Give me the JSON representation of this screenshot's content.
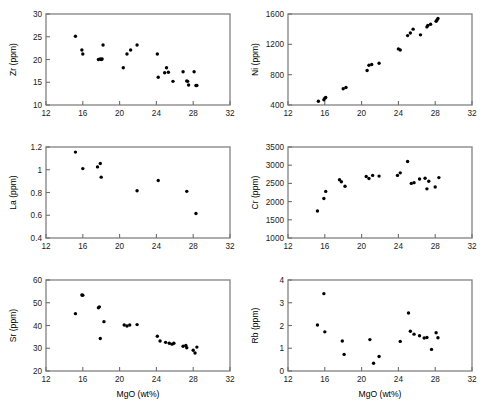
{
  "figure": {
    "title": "",
    "shared_xlabel": "MgO (wt%)",
    "xlim": [
      12,
      32
    ],
    "xticks": [
      12,
      16,
      20,
      24,
      28,
      32
    ],
    "point_color": "#000000",
    "axis_color": "#8a8a8a"
  },
  "chart_data": [
    {
      "type": "scatter",
      "id": "zr",
      "title": "",
      "xlabel": "MgO (wt%)",
      "ylabel": "Zr (ppm)",
      "xlim": [
        12,
        32
      ],
      "ylim": [
        10,
        30
      ],
      "xticks": [
        12,
        16,
        20,
        24,
        28,
        32
      ],
      "yticks": [
        10,
        15,
        20,
        25,
        30
      ],
      "grid": false,
      "legend": "none",
      "x": [
        15.2,
        15.9,
        16.0,
        17.7,
        17.9,
        18.0,
        18.1,
        18.2,
        20.4,
        20.8,
        21.2,
        21.9,
        24.1,
        24.2,
        24.9,
        25.1,
        25.3,
        25.8,
        26.9,
        27.3,
        27.4,
        27.5,
        28.1,
        28.3,
        28.4
      ],
      "y": [
        25.1,
        22.1,
        21.2,
        20.0,
        20.1,
        20.0,
        20.1,
        23.2,
        18.2,
        21.2,
        22.1,
        23.2,
        21.2,
        16.1,
        17.1,
        18.2,
        17.2,
        15.2,
        17.3,
        15.3,
        15.2,
        14.4,
        17.3,
        14.3,
        14.3
      ]
    },
    {
      "type": "scatter",
      "id": "ni",
      "title": "",
      "xlabel": "MgO (wt%)",
      "ylabel": "Ni (ppm)",
      "xlim": [
        12,
        32
      ],
      "ylim": [
        400,
        1600
      ],
      "xticks": [
        12,
        16,
        20,
        24,
        28,
        32
      ],
      "yticks": [
        400,
        800,
        1200,
        1600
      ],
      "grid": false,
      "legend": "none",
      "x": [
        15.3,
        15.9,
        16.0,
        16.1,
        18.0,
        18.3,
        20.6,
        20.8,
        21.1,
        21.9,
        24.0,
        24.2,
        25.0,
        25.3,
        25.6,
        26.4,
        27.1,
        27.2,
        27.5,
        28.1,
        28.2,
        28.3
      ],
      "y": [
        450,
        470,
        490,
        500,
        615,
        630,
        855,
        925,
        935,
        950,
        1140,
        1125,
        1315,
        1350,
        1400,
        1325,
        1430,
        1450,
        1465,
        1505,
        1520,
        1540
      ]
    },
    {
      "type": "scatter",
      "id": "la",
      "title": "",
      "xlabel": "MgO (wt%)",
      "ylabel": "La (ppm)",
      "xlim": [
        12,
        32
      ],
      "ylim": [
        0.4,
        1.2
      ],
      "xticks": [
        12,
        16,
        20,
        24,
        28,
        32
      ],
      "yticks": [
        0.4,
        0.6,
        0.8,
        1.0,
        1.2
      ],
      "grid": false,
      "legend": "none",
      "x": [
        15.2,
        16.0,
        17.6,
        17.9,
        18.0,
        21.9,
        24.2,
        27.3,
        28.3
      ],
      "y": [
        1.155,
        1.01,
        1.025,
        1.055,
        0.935,
        0.815,
        0.905,
        0.81,
        0.615
      ]
    },
    {
      "type": "scatter",
      "id": "cr",
      "title": "",
      "xlabel": "MgO (wt%)",
      "ylabel": "Cr (ppm)",
      "xlim": [
        12,
        32
      ],
      "ylim": [
        1000,
        3500
      ],
      "xticks": [
        12,
        16,
        20,
        24,
        28,
        32
      ],
      "yticks": [
        1000,
        1500,
        2000,
        2500,
        3000,
        3500
      ],
      "grid": false,
      "legend": "none",
      "x": [
        15.2,
        15.9,
        16.1,
        17.6,
        17.8,
        18.2,
        20.5,
        20.8,
        21.2,
        21.9,
        23.9,
        24.2,
        25.0,
        25.4,
        25.7,
        26.3,
        26.9,
        27.1,
        27.3,
        28.0,
        28.4
      ],
      "y": [
        1740,
        2085,
        2280,
        2600,
        2545,
        2420,
        2690,
        2635,
        2720,
        2700,
        2720,
        2790,
        3100,
        2500,
        2520,
        2620,
        2640,
        2350,
        2560,
        2400,
        2660
      ]
    },
    {
      "type": "scatter",
      "id": "sr",
      "title": "",
      "xlabel": "MgO (wt%)",
      "ylabel": "Sr (ppm)",
      "xlim": [
        12,
        32
      ],
      "ylim": [
        20,
        60
      ],
      "xticks": [
        12,
        16,
        20,
        24,
        28,
        32
      ],
      "yticks": [
        20,
        30,
        40,
        50,
        60
      ],
      "grid": false,
      "legend": "none",
      "x": [
        15.2,
        15.9,
        16.0,
        17.7,
        17.8,
        17.9,
        18.3,
        20.5,
        20.8,
        21.1,
        21.9,
        24.1,
        24.4,
        25.0,
        25.4,
        25.7,
        25.9,
        26.9,
        27.2,
        27.3,
        28.0,
        28.2,
        28.4
      ],
      "y": [
        45.2,
        53.4,
        53.3,
        47.8,
        48.2,
        34.3,
        41.7,
        40.2,
        39.8,
        40.2,
        40.4,
        35.3,
        33.2,
        32.6,
        32.2,
        31.8,
        32.2,
        30.9,
        31.2,
        30.2,
        29.1,
        27.9,
        30.5
      ]
    },
    {
      "type": "scatter",
      "id": "rb",
      "title": "",
      "xlabel": "MgO (wt%)",
      "ylabel": "Rb (ppm)",
      "xlim": [
        12,
        32
      ],
      "ylim": [
        0,
        4
      ],
      "xticks": [
        12,
        16,
        20,
        24,
        28,
        32
      ],
      "yticks": [
        0,
        1,
        2,
        3,
        4
      ],
      "grid": false,
      "legend": "none",
      "x": [
        15.2,
        15.9,
        16.0,
        17.9,
        18.1,
        20.9,
        21.3,
        21.9,
        24.2,
        25.1,
        25.3,
        25.7,
        26.3,
        26.8,
        27.1,
        27.6,
        28.1,
        28.3
      ],
      "y": [
        2.02,
        3.4,
        1.72,
        1.32,
        0.73,
        1.38,
        0.34,
        0.64,
        1.3,
        2.55,
        1.75,
        1.62,
        1.55,
        1.45,
        1.47,
        0.95,
        1.68,
        1.46
      ]
    }
  ]
}
